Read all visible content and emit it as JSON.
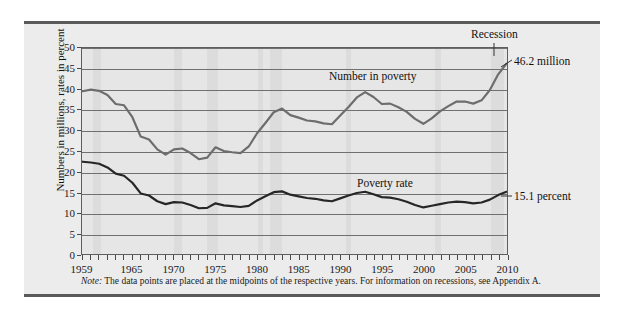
{
  "figure": {
    "note_prefix": "Note:",
    "note_text": " The data points are placed at the midpoints of the respective years. For information on recessions, see Appendix A.",
    "background": "#ececec",
    "plot_background": "#e6e6e6",
    "recession_band_color": "#dcdcdc"
  },
  "annotations": {
    "recession": "Recession",
    "number_series_label": "Number in poverty",
    "rate_series_label": "Poverty rate",
    "number_end_value": "46.2 million",
    "rate_end_value": "15.1 percent"
  },
  "chart_data": {
    "type": "line",
    "title": "",
    "xlabel": "",
    "ylabel": "Numbers in millions, rates in percent",
    "xlim": [
      1959,
      2010
    ],
    "ylim": [
      0,
      50
    ],
    "yticks": [
      0,
      5,
      10,
      15,
      20,
      25,
      30,
      35,
      40,
      45,
      50
    ],
    "xticks_labeled": [
      1959,
      1965,
      1970,
      1975,
      1980,
      1985,
      1990,
      1995,
      2000,
      2005,
      2010
    ],
    "grid": "horizontal",
    "legend": "inline-annotations",
    "x": [
      1959,
      1960,
      1961,
      1962,
      1963,
      1964,
      1965,
      1966,
      1967,
      1968,
      1969,
      1970,
      1971,
      1972,
      1973,
      1974,
      1975,
      1976,
      1977,
      1978,
      1979,
      1980,
      1981,
      1982,
      1983,
      1984,
      1985,
      1986,
      1987,
      1988,
      1989,
      1990,
      1991,
      1992,
      1993,
      1994,
      1995,
      1996,
      1997,
      1998,
      1999,
      2000,
      2001,
      2002,
      2003,
      2004,
      2005,
      2006,
      2007,
      2008,
      2009,
      2010
    ],
    "series": [
      {
        "name": "Number in poverty",
        "unit": "millions",
        "color": "#6d6d6d",
        "values": [
          39.5,
          39.9,
          39.6,
          38.6,
          36.4,
          36.1,
          33.2,
          28.5,
          27.8,
          25.4,
          24.1,
          25.4,
          25.6,
          24.5,
          23.0,
          23.4,
          25.9,
          25.0,
          24.7,
          24.5,
          26.1,
          29.3,
          31.8,
          34.4,
          35.3,
          33.7,
          33.1,
          32.4,
          32.2,
          31.7,
          31.5,
          33.6,
          35.7,
          38.0,
          39.3,
          38.1,
          36.4,
          36.5,
          35.6,
          34.5,
          32.8,
          31.6,
          32.9,
          34.6,
          35.9,
          37.0,
          37.0,
          36.5,
          37.3,
          39.8,
          43.6,
          46.2
        ]
      },
      {
        "name": "Poverty rate",
        "unit": "percent",
        "color": "#262626",
        "values": [
          22.4,
          22.2,
          21.9,
          21.0,
          19.5,
          19.0,
          17.3,
          14.7,
          14.2,
          12.8,
          12.1,
          12.6,
          12.5,
          11.9,
          11.1,
          11.2,
          12.3,
          11.8,
          11.6,
          11.4,
          11.7,
          13.0,
          14.0,
          15.0,
          15.2,
          14.4,
          14.0,
          13.6,
          13.4,
          13.0,
          12.8,
          13.5,
          14.2,
          14.8,
          15.1,
          14.5,
          13.8,
          13.7,
          13.3,
          12.7,
          11.9,
          11.3,
          11.7,
          12.1,
          12.5,
          12.7,
          12.6,
          12.3,
          12.5,
          13.2,
          14.3,
          15.1
        ]
      }
    ],
    "recessions": [
      {
        "start": 1960.3,
        "end": 1961.2
      },
      {
        "start": 1970.0,
        "end": 1970.9
      },
      {
        "start": 1973.9,
        "end": 1975.2
      },
      {
        "start": 1980.0,
        "end": 1980.6
      },
      {
        "start": 1981.5,
        "end": 1982.9
      },
      {
        "start": 1990.5,
        "end": 1991.2
      },
      {
        "start": 2001.2,
        "end": 2001.9
      },
      {
        "start": 2007.9,
        "end": 2009.5
      }
    ]
  }
}
